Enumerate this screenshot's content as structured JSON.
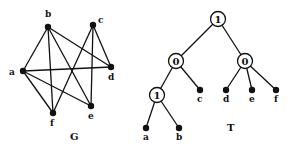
{
  "graph_G": {
    "caption": "G",
    "nodes": [
      {
        "id": "a",
        "x": 23,
        "y": 71,
        "lx": 9,
        "ly": 75
      },
      {
        "id": "b",
        "x": 48,
        "y": 27,
        "lx": 45,
        "ly": 17
      },
      {
        "id": "c",
        "x": 93,
        "y": 25,
        "lx": 98,
        "ly": 23
      },
      {
        "id": "d",
        "x": 111,
        "y": 67,
        "lx": 108,
        "ly": 80
      },
      {
        "id": "e",
        "x": 91,
        "y": 106,
        "lx": 88,
        "ly": 119
      },
      {
        "id": "f",
        "x": 53,
        "y": 113,
        "lx": 50,
        "ly": 126
      }
    ],
    "edges": [
      [
        "a",
        "b"
      ],
      [
        "a",
        "d"
      ],
      [
        "a",
        "e"
      ],
      [
        "a",
        "f"
      ],
      [
        "b",
        "d"
      ],
      [
        "b",
        "e"
      ],
      [
        "b",
        "f"
      ],
      [
        "c",
        "d"
      ],
      [
        "c",
        "e"
      ],
      [
        "c",
        "f"
      ]
    ],
    "caption_pos": {
      "x": 70,
      "y": 140
    }
  },
  "tree_T": {
    "caption": "T",
    "caption_pos": {
      "x": 227,
      "y": 131
    },
    "internal": [
      {
        "id": "r",
        "label": "1",
        "x": 218,
        "y": 19
      },
      {
        "id": "l",
        "label": "0",
        "x": 176,
        "y": 61
      },
      {
        "id": "rr",
        "label": "0",
        "x": 245,
        "y": 61
      },
      {
        "id": "ll",
        "label": "1",
        "x": 157,
        "y": 95
      }
    ],
    "leaves": [
      {
        "id": "a",
        "x": 146,
        "y": 128,
        "lx": 143,
        "ly": 140
      },
      {
        "id": "b",
        "x": 179,
        "y": 128,
        "lx": 176,
        "ly": 140
      },
      {
        "id": "c",
        "x": 200,
        "y": 90,
        "lx": 197,
        "ly": 102
      },
      {
        "id": "d",
        "x": 226,
        "y": 90,
        "lx": 223,
        "ly": 102
      },
      {
        "id": "e",
        "x": 252,
        "y": 90,
        "lx": 249,
        "ly": 102
      },
      {
        "id": "f",
        "x": 276,
        "y": 90,
        "lx": 274,
        "ly": 102
      }
    ],
    "edges": [
      [
        "r",
        "l"
      ],
      [
        "r",
        "rr"
      ],
      [
        "l",
        "ll"
      ],
      [
        "l",
        "c"
      ],
      [
        "rr",
        "d"
      ],
      [
        "rr",
        "e"
      ],
      [
        "rr",
        "f"
      ],
      [
        "ll",
        "a"
      ],
      [
        "ll",
        "b"
      ]
    ]
  }
}
